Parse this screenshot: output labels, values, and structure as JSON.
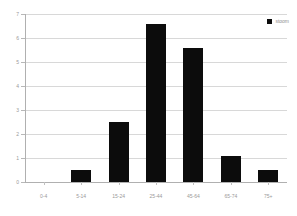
{
  "chart_data": {
    "type": "bar",
    "title": "",
    "subtitle": "",
    "xlabel": "",
    "ylabel": "",
    "categories": [
      "0-4",
      "5-14",
      "15-24",
      "25-44",
      "45-64",
      "65-74",
      "75+"
    ],
    "values": [
      0,
      0.5,
      2.5,
      6.6,
      5.6,
      1.1,
      0.5
    ],
    "series": [
      {
        "name": "stoom",
        "values": [
          0,
          0.5,
          2.5,
          6.6,
          5.6,
          1.1,
          0.5
        ],
        "color": "#0c0c0c"
      }
    ],
    "ylim": [
      0,
      7
    ],
    "yticks": [
      0,
      1,
      2,
      3,
      4,
      5,
      6,
      7
    ],
    "ytick_labels": [
      "0",
      "1",
      "2",
      "3",
      "4",
      "5",
      "6",
      "7"
    ],
    "grid": true,
    "grid_axis": "y",
    "legend": {
      "position": "top-right",
      "entries": [
        {
          "label": "stoom",
          "swatch_name": "legend-swatch-series-1",
          "color": "#0c0c0c"
        }
      ]
    },
    "colors": {
      "bar": "#0c0c0c",
      "gridline": "#d8d8d8",
      "axis": "#b0b0b0",
      "tick_label": "#9a9a9a",
      "background": "#ffffff"
    }
  }
}
